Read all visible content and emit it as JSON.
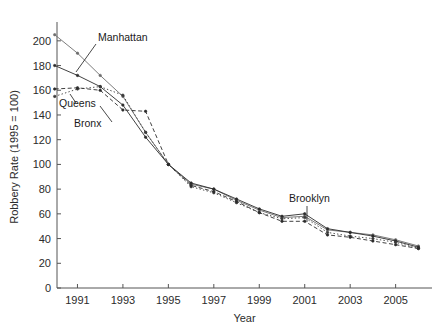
{
  "chart_data": {
    "type": "line",
    "title": "",
    "xlabel": "Year",
    "ylabel": "Robbery Rate (1995 = 100)",
    "xlim": [
      1990.1,
      2006.6
    ],
    "ylim": [
      0,
      212
    ],
    "xticks": [
      1991,
      1993,
      1995,
      1997,
      1999,
      2001,
      2003,
      2005
    ],
    "xtick_labels": [
      "1991",
      "1993",
      "1995",
      "1997",
      "1999",
      "2001",
      "2003",
      "2005"
    ],
    "yticks": [
      0,
      20,
      40,
      60,
      80,
      100,
      120,
      140,
      160,
      180,
      200
    ],
    "ytick_labels": [
      "0",
      "20",
      "40",
      "60",
      "80",
      "100",
      "120",
      "140",
      "160",
      "180",
      "200"
    ],
    "grid": false,
    "legend_position": "inline-annotations",
    "x": [
      1990,
      1991,
      1992,
      1993,
      1994,
      1995,
      1996,
      1997,
      1998,
      1999,
      2000,
      2001,
      2002,
      2003,
      2004,
      2005,
      2006
    ],
    "series": [
      {
        "name": "Manhattan",
        "style": "solid-thin",
        "color": "#6d6d6d",
        "values": [
          205,
          190,
          172,
          155,
          126,
          100,
          84,
          80,
          71,
          63,
          57,
          58,
          47,
          45,
          43,
          39,
          34
        ]
      },
      {
        "name": "Brooklyn",
        "style": "solid",
        "color": "#2b2b2b",
        "values": [
          180,
          172,
          163,
          148,
          122,
          100,
          85,
          80,
          72,
          64,
          58,
          60,
          48,
          45,
          42,
          38,
          33
        ]
      },
      {
        "name": "Queens",
        "style": "dotted",
        "color": "#3a3a3a",
        "values": [
          155,
          161,
          163,
          156,
          126,
          100,
          82,
          77,
          69,
          61,
          56,
          57,
          45,
          42,
          40,
          37,
          32
        ]
      },
      {
        "name": "Bronx",
        "style": "dashed",
        "color": "#2b2b2b",
        "values": [
          161,
          162,
          160,
          144,
          143,
          100,
          83,
          78,
          70,
          61,
          54,
          54,
          43,
          41,
          38,
          35,
          32
        ]
      }
    ],
    "annotations": [
      {
        "text": "Manhattan",
        "label_x": 98,
        "label_y": 41,
        "anchor": "start",
        "leader": [
          [
            96,
            44
          ],
          [
            76,
            72
          ]
        ]
      },
      {
        "text": "Queens",
        "label_x": 59,
        "label_y": 107,
        "anchor": "start",
        "leader": [
          [
            76,
            103
          ],
          [
            70,
            94
          ]
        ]
      },
      {
        "text": "Bronx",
        "label_x": 74,
        "label_y": 127,
        "anchor": "start",
        "leader": [
          [
            112,
            122
          ],
          [
            100,
            106
          ]
        ]
      },
      {
        "text": "Brooklyn",
        "label_x": 289,
        "label_y": 202,
        "anchor": "start",
        "leader": [
          [
            307,
            206
          ],
          [
            307,
            222
          ]
        ]
      }
    ]
  }
}
